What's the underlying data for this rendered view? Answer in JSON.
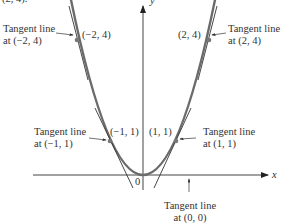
{
  "top_fragment": "(2, 4).",
  "axes": {
    "x_label": "x",
    "y_label": "y",
    "origin_label": "0"
  },
  "curve": "y = x^2",
  "points": [
    {
      "label": "(−2, 4)",
      "x": -2,
      "y": 4
    },
    {
      "label": "(2, 4)",
      "x": 2,
      "y": 4
    },
    {
      "label": "(−1, 1)",
      "x": -1,
      "y": 1
    },
    {
      "label": "(1, 1)",
      "x": 1,
      "y": 1
    }
  ],
  "annotations": {
    "tl_m2": {
      "line1": "Tangent line",
      "line2": "at (−2, 4)"
    },
    "tl_p2": {
      "line1": "Tangent line",
      "line2": "at (2, 4)"
    },
    "tl_m1": {
      "line1": "Tangent line",
      "line2": "at (−1, 1)"
    },
    "tl_p1": {
      "line1": "Tangent line",
      "line2": "at (1, 1)"
    },
    "tl_0": {
      "line1": "Tangent line",
      "line2": "at (0, 0)"
    }
  },
  "colors": {
    "curve": "#6b6b6b",
    "tangent": "#333333",
    "axis": "#333333",
    "point": "#777777"
  }
}
